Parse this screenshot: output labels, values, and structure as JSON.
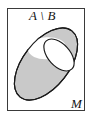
{
  "figure": {
    "kind": "venn-set-difference-diagram",
    "caption_label": "A \\ B",
    "universe_label": "M",
    "set_a_label": "A",
    "set_b_label": "B",
    "operator": "\\",
    "shaded_region_meaning": "A \\ B",
    "colors": {
      "shaded_fill": "#c9c9c9",
      "outline": "#1a1a1a",
      "frame_border": "#3a3a3a",
      "background": "#ffffff",
      "label_text": "#141414"
    },
    "frame": {
      "x": 7,
      "y": 8,
      "width": 78,
      "height": 103
    },
    "shapes": [
      {
        "name": "set-a-ellipse",
        "fill": "shaded",
        "cx": 46,
        "cy": 64,
        "rx": 42,
        "ry": 23,
        "rotation_deg": -52
      },
      {
        "name": "set-b-ellipse",
        "fill": "white",
        "cx": 59,
        "cy": 55,
        "rx": 19,
        "ry": 11,
        "rotation_deg": 48
      }
    ]
  }
}
